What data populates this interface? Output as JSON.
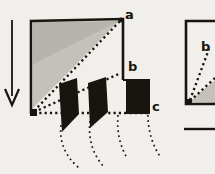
{
  "colors": {
    "paper": "#f1efeb",
    "ink": "#18140e",
    "shade": "#c4c0ba"
  },
  "diagram": {
    "main_figure": {
      "label_a": "a",
      "label_b": "b",
      "label_c": "c"
    },
    "right_figure": {
      "label_b": "b"
    }
  }
}
